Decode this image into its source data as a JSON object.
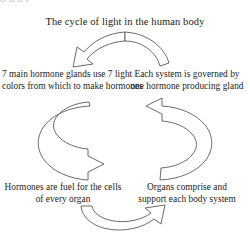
{
  "figure": {
    "type": "cycle-diagram",
    "title": "The cycle of light in the human body",
    "cutoff_text_above": "g g g p",
    "background_color": "#ffffff",
    "stroke_color": "#5a5a5a",
    "text_color": "#1a1a1a"
  },
  "nodes": {
    "glands": {
      "position": "left",
      "line1": "7 main hormone glands use 7 light",
      "line2": "colors from which to make hormones"
    },
    "systems": {
      "position": "right",
      "line1": "Each system is governed by",
      "line2": "one hormone producing gland"
    },
    "hormones_fuel": {
      "position": "bottom-left",
      "line1": "Hormones are fuel for the cells",
      "line2": "of every organ"
    },
    "organs": {
      "position": "bottom-right",
      "line1": "Organs comprise and",
      "line2": "support each body system"
    }
  },
  "arrows": [
    {
      "name": "arrow-top",
      "direction": "right-to-left",
      "shape": "arc-over-top",
      "from": "systems",
      "to": "glands"
    },
    {
      "name": "arrow-left",
      "direction": "top-to-bottom",
      "shape": "c-curve-opening-right",
      "from": "glands",
      "to": "hormones_fuel"
    },
    {
      "name": "arrow-right",
      "direction": "bottom-to-top",
      "shape": "reverse-c-curve-opening-left",
      "from": "organs",
      "to": "systems"
    },
    {
      "name": "arrow-bottom",
      "direction": "left-to-right",
      "shape": "arc-under-bottom",
      "from": "hormones_fuel",
      "to": "organs"
    }
  ]
}
